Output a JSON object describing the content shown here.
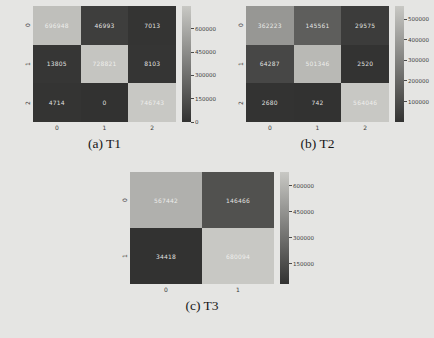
{
  "figure": {
    "background": "#e5e5e3",
    "colormap": {
      "dark": "#323231",
      "light": "#c8c8c4"
    }
  },
  "chart_data": [
    {
      "type": "heatmap",
      "caption": "(a) T1",
      "x_ticks": [
        "0",
        "1",
        "2"
      ],
      "y_ticks": [
        "0",
        "1",
        "2"
      ],
      "rows": [
        [
          696948,
          46993,
          7013
        ],
        [
          13805,
          728821,
          8103
        ],
        [
          4714,
          0,
          746743
        ]
      ],
      "vmin": 0,
      "vmax": 746743,
      "colorbar_ticks": [
        600000,
        450000,
        300000,
        150000,
        0
      ],
      "legend_position": "right",
      "grid": false
    },
    {
      "type": "heatmap",
      "caption": "(b) T2",
      "x_ticks": [
        "0",
        "1",
        "2"
      ],
      "y_ticks": [
        "0",
        "1",
        "2"
      ],
      "rows": [
        [
          362223,
          145561,
          29575
        ],
        [
          64287,
          501346,
          2520
        ],
        [
          2680,
          742,
          564046
        ]
      ],
      "vmin": 742,
      "vmax": 564046,
      "colorbar_ticks": [
        500000,
        400000,
        300000,
        200000,
        100000
      ],
      "legend_position": "right",
      "grid": false
    },
    {
      "type": "heatmap",
      "caption": "(c) T3",
      "x_ticks": [
        "0",
        "1"
      ],
      "y_ticks": [
        "0",
        "1"
      ],
      "rows": [
        [
          567442,
          146466
        ],
        [
          34418,
          680094
        ]
      ],
      "vmin": 34418,
      "vmax": 680094,
      "colorbar_ticks": [
        600000,
        450000,
        300000,
        150000
      ],
      "legend_position": "right",
      "grid": false
    }
  ]
}
